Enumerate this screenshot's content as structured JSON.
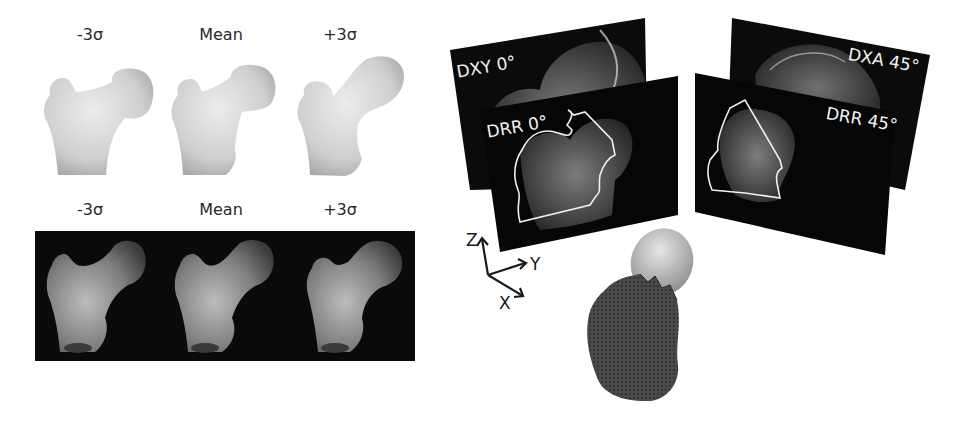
{
  "top_row": {
    "labels": [
      "-3σ",
      "Mean",
      "+3σ"
    ],
    "style": "surface render, light gray on white"
  },
  "bottom_row": {
    "labels": [
      "-3σ",
      "Mean",
      "+3σ"
    ],
    "style": "shaded render on black background"
  },
  "projections": {
    "dxy_0": "DXY 0°",
    "drr_0": "DRR 0°",
    "dxa_45": "DXA 45°",
    "drr_45": "DRR 45°"
  },
  "axes": {
    "z": "Z",
    "y": "Y",
    "x": "X"
  },
  "colors": {
    "panel_bg": "#0a0a0a",
    "bone_light": "#d6d6d6",
    "contour": "#ececec",
    "mesh": "#3a3a3a"
  }
}
